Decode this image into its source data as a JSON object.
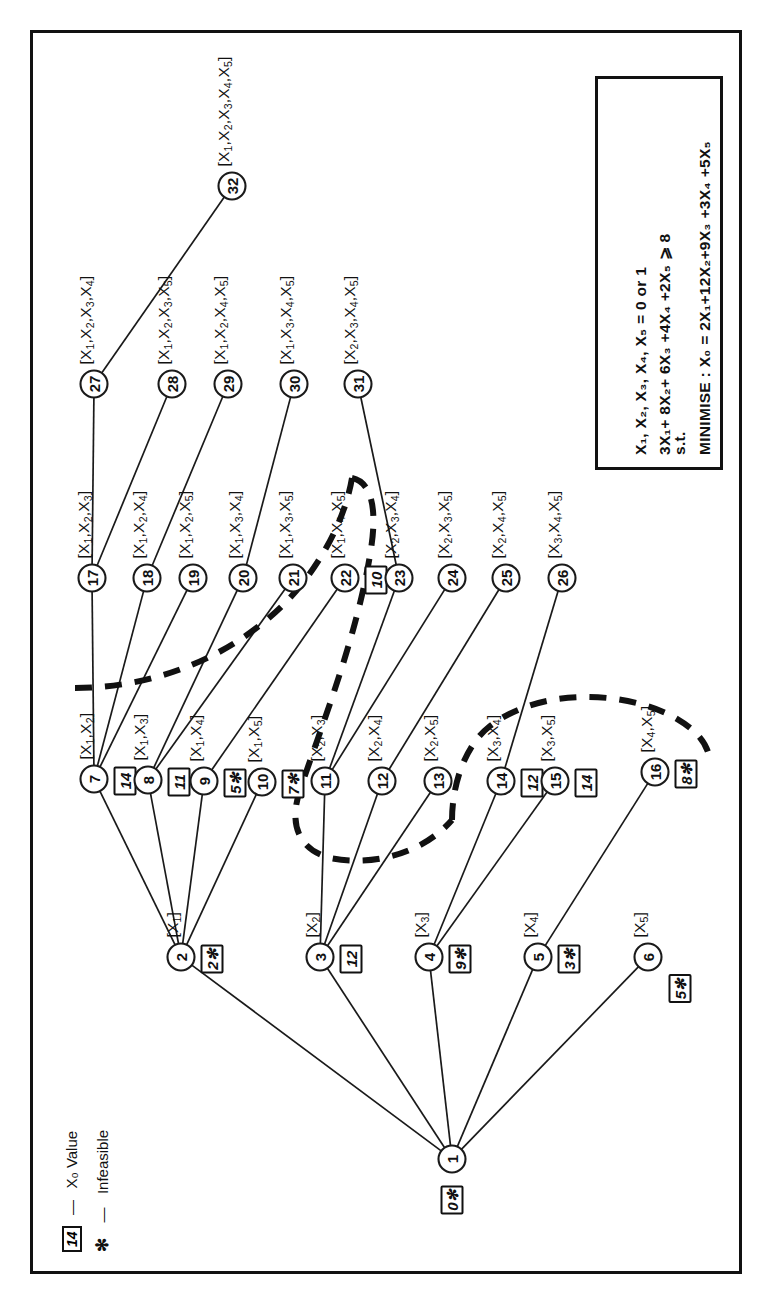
{
  "figure": {
    "type": "branch-and-bound-tree",
    "orientation": "rotated-90-ccw"
  },
  "lp_model": {
    "objective_line": "MINIMISE : X₀ = 2X₁+12X₂+9X₃ +3X₄ +5X₅",
    "constraint_prefix": "s.t.",
    "constraint_line": "3X₁+ 8X₂+ 6X₃ +4X₄ +2X₅  ⩾ 8",
    "binary_line": "X₁, X₂, X₃, X₄, X₅ = 0 or 1"
  },
  "legend": {
    "value_key_box": "14",
    "value_key_dash": "—",
    "value_key_text": "X₀  Value",
    "infeasible_key_symbol": "✻",
    "infeasible_key_dash": "—",
    "infeasible_key_text": "Infeasible"
  },
  "nodes": [
    {
      "id": "1",
      "num": "1",
      "set": "",
      "value": "0",
      "infeasible": true,
      "level": 0
    },
    {
      "id": "2",
      "num": "2",
      "set": "[X₁]",
      "value": "2",
      "infeasible": true,
      "level": 1
    },
    {
      "id": "3",
      "num": "3",
      "set": "[X₂]",
      "value": "12",
      "infeasible": false,
      "level": 1
    },
    {
      "id": "4",
      "num": "4",
      "set": "[X₃]",
      "value": "9",
      "infeasible": true,
      "level": 1
    },
    {
      "id": "5",
      "num": "5",
      "set": "[X₄]",
      "value": "3",
      "infeasible": true,
      "level": 1
    },
    {
      "id": "6",
      "num": "6",
      "set": "[X₅]",
      "value": "5",
      "infeasible": true,
      "level": 1
    },
    {
      "id": "7",
      "num": "7",
      "set": "[X₁,X₂]",
      "value": "14",
      "infeasible": false,
      "level": 2
    },
    {
      "id": "8",
      "num": "8",
      "set": "[X₁,X₃]",
      "value": "11",
      "infeasible": false,
      "level": 2
    },
    {
      "id": "9",
      "num": "9",
      "set": "[X₁,X₄]",
      "value": "5",
      "infeasible": true,
      "level": 2
    },
    {
      "id": "10",
      "num": "10",
      "set": "[X₁,X₅]",
      "value": "7",
      "infeasible": true,
      "level": 2
    },
    {
      "id": "11",
      "num": "11",
      "set": "[X₂,X₃]",
      "value": "",
      "infeasible": false,
      "level": 2
    },
    {
      "id": "12",
      "num": "12",
      "set": "[X₂,X₄]",
      "value": "",
      "infeasible": false,
      "level": 2
    },
    {
      "id": "13",
      "num": "13",
      "set": "[X₂,X₅]",
      "value": "",
      "infeasible": false,
      "level": 2
    },
    {
      "id": "14",
      "num": "14",
      "set": "[X₃,X₄]",
      "value": "12",
      "infeasible": false,
      "level": 2
    },
    {
      "id": "15",
      "num": "15",
      "set": "[X₃,X₅]",
      "value": "14",
      "infeasible": false,
      "level": 2
    },
    {
      "id": "16",
      "num": "16",
      "set": "[X₄,X₅]",
      "value": "8",
      "infeasible": true,
      "level": 2
    },
    {
      "id": "17",
      "num": "17",
      "set": "[X₁,X₂,X₃]",
      "value": "",
      "infeasible": false,
      "level": 3
    },
    {
      "id": "18",
      "num": "18",
      "set": "[X₁,X₂,X₄]",
      "value": "",
      "infeasible": false,
      "level": 3
    },
    {
      "id": "19",
      "num": "19",
      "set": "[X₁,X₂,X₅]",
      "value": "",
      "infeasible": false,
      "level": 3
    },
    {
      "id": "20",
      "num": "20",
      "set": "[X₁,X₃,X₄]",
      "value": "",
      "infeasible": false,
      "level": 3
    },
    {
      "id": "21",
      "num": "21",
      "set": "[X₁,X₃,X₅]",
      "value": "",
      "infeasible": false,
      "level": 3
    },
    {
      "id": "22",
      "num": "22",
      "set": "[X₁,X₄,X₅]",
      "value": "10",
      "infeasible": false,
      "level": 3
    },
    {
      "id": "23",
      "num": "23",
      "set": "[X₂,X₃,X₄]",
      "value": "",
      "infeasible": false,
      "level": 3
    },
    {
      "id": "24",
      "num": "24",
      "set": "[X₂,X₃,X₅]",
      "value": "",
      "infeasible": false,
      "level": 3
    },
    {
      "id": "25",
      "num": "25",
      "set": "[X₂,X₄,X₅]",
      "value": "",
      "infeasible": false,
      "level": 3
    },
    {
      "id": "26",
      "num": "26",
      "set": "[X₃,X₄,X₅]",
      "value": "",
      "infeasible": false,
      "level": 3
    },
    {
      "id": "27",
      "num": "27",
      "set": "[X₁,X₂,X₃,X₄]",
      "value": "",
      "infeasible": false,
      "level": 4
    },
    {
      "id": "28",
      "num": "28",
      "set": "[X₁,X₂,X₃,X₅]",
      "value": "",
      "infeasible": false,
      "level": 4
    },
    {
      "id": "29",
      "num": "29",
      "set": "[X₁,X₂,X₄,X₅]",
      "value": "",
      "infeasible": false,
      "level": 4
    },
    {
      "id": "30",
      "num": "30",
      "set": "[X₁,X₃,X₄,X₅]",
      "value": "",
      "infeasible": false,
      "level": 4
    },
    {
      "id": "31",
      "num": "31",
      "set": "[X₂,X₃,X₄,X₅]",
      "value": "",
      "infeasible": false,
      "level": 4
    },
    {
      "id": "32",
      "num": "32",
      "set": "[X₁,X₂,X₃,X₄,X₅]",
      "value": "",
      "infeasible": false,
      "level": 5
    }
  ],
  "edges": [
    [
      "1",
      "2"
    ],
    [
      "1",
      "3"
    ],
    [
      "1",
      "4"
    ],
    [
      "1",
      "5"
    ],
    [
      "1",
      "6"
    ],
    [
      "2",
      "7"
    ],
    [
      "2",
      "8"
    ],
    [
      "2",
      "9"
    ],
    [
      "2",
      "10"
    ],
    [
      "3",
      "11"
    ],
    [
      "3",
      "12"
    ],
    [
      "3",
      "13"
    ],
    [
      "4",
      "14"
    ],
    [
      "4",
      "15"
    ],
    [
      "5",
      "16"
    ],
    [
      "7",
      "17"
    ],
    [
      "7",
      "18"
    ],
    [
      "7",
      "19"
    ],
    [
      "8",
      "20"
    ],
    [
      "8",
      "21"
    ],
    [
      "9",
      "22"
    ],
    [
      "11",
      "23"
    ],
    [
      "11",
      "24"
    ],
    [
      "12",
      "25"
    ],
    [
      "14",
      "26"
    ],
    [
      "17",
      "27"
    ],
    [
      "17",
      "28"
    ],
    [
      "18",
      "29"
    ],
    [
      "20",
      "30"
    ],
    [
      "23",
      "31"
    ],
    [
      "27",
      "32"
    ]
  ]
}
